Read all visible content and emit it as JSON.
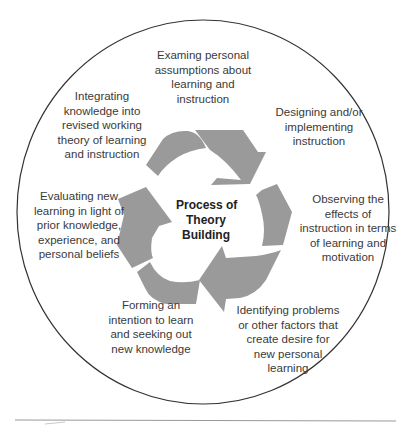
{
  "diagram": {
    "title": "Process of Theory Building",
    "center_lines": [
      "Process of",
      "Theory",
      "Building"
    ],
    "steps": [
      {
        "position": "top",
        "lines": [
          "Examing personal",
          "assumptions about",
          "learning and",
          "instruction"
        ]
      },
      {
        "position": "upper-right",
        "lines": [
          "Designing and/or",
          "implementing",
          "instruction"
        ]
      },
      {
        "position": "right",
        "lines": [
          "Observing the",
          "effects of",
          "instruction in terms",
          "of learning and",
          "motivation"
        ]
      },
      {
        "position": "lower-right",
        "lines": [
          "Identifying problems",
          "or other factors that",
          "create desire for",
          "new personal",
          "learning"
        ]
      },
      {
        "position": "lower-left",
        "lines": [
          "Forming an",
          "intention to learn",
          "and seeking out",
          "new knowledge"
        ]
      },
      {
        "position": "left",
        "lines": [
          "Evaluating new",
          "learning in light of",
          "prior knowledge,",
          "experience, and",
          "personal beliefs"
        ]
      },
      {
        "position": "upper-left",
        "lines": [
          "Integrating",
          "knowledge into",
          "revised working",
          "theory of learning",
          "and instruction"
        ]
      }
    ],
    "colors": {
      "arrow_fill": "#9a9a9a",
      "circle_stroke": "#333333",
      "rule_stroke": "#999999"
    }
  }
}
